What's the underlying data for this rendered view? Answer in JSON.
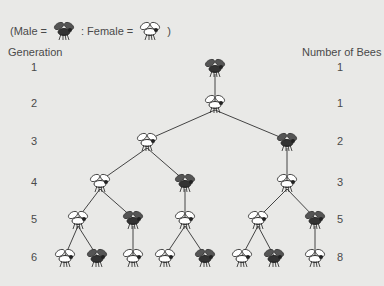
{
  "legend": {
    "open": "(Male =",
    "sep": ": Female =",
    "close": ")",
    "male_icon": "male-bee-icon",
    "female_icon": "female-bee-icon"
  },
  "headers": {
    "left": "Generation",
    "right": "Number of Bees"
  },
  "generations": [
    {
      "gen": "1",
      "count": "1",
      "y": 68
    },
    {
      "gen": "2",
      "count": "1",
      "y": 104
    },
    {
      "gen": "3",
      "count": "2",
      "y": 142
    },
    {
      "gen": "4",
      "count": "3",
      "y": 183
    },
    {
      "gen": "5",
      "count": "5",
      "y": 220
    },
    {
      "gen": "6",
      "count": "8",
      "y": 258
    }
  ],
  "colors": {
    "background": "#e9e9e7",
    "text": "#4a4a4a",
    "line": "#444444",
    "male_body": "#333333",
    "female_body": "#ffffff"
  },
  "tree": {
    "nodes": [
      {
        "id": "a",
        "sex": "M",
        "x": 215,
        "y": 68
      },
      {
        "id": "b",
        "sex": "F",
        "x": 215,
        "y": 104
      },
      {
        "id": "c1",
        "sex": "F",
        "x": 147,
        "y": 142
      },
      {
        "id": "c2",
        "sex": "M",
        "x": 287,
        "y": 142
      },
      {
        "id": "d1",
        "sex": "F",
        "x": 100,
        "y": 183
      },
      {
        "id": "d2",
        "sex": "M",
        "x": 185,
        "y": 183
      },
      {
        "id": "d3",
        "sex": "F",
        "x": 287,
        "y": 183
      },
      {
        "id": "e1",
        "sex": "F",
        "x": 78,
        "y": 220
      },
      {
        "id": "e2",
        "sex": "M",
        "x": 133,
        "y": 220
      },
      {
        "id": "e3",
        "sex": "F",
        "x": 185,
        "y": 220
      },
      {
        "id": "e4",
        "sex": "F",
        "x": 258,
        "y": 220
      },
      {
        "id": "e5",
        "sex": "M",
        "x": 315,
        "y": 220
      },
      {
        "id": "f1",
        "sex": "F",
        "x": 65,
        "y": 258
      },
      {
        "id": "f2",
        "sex": "M",
        "x": 97,
        "y": 258
      },
      {
        "id": "f3",
        "sex": "F",
        "x": 133,
        "y": 258
      },
      {
        "id": "f4",
        "sex": "F",
        "x": 165,
        "y": 258
      },
      {
        "id": "f5",
        "sex": "M",
        "x": 205,
        "y": 258
      },
      {
        "id": "f6",
        "sex": "F",
        "x": 242,
        "y": 258
      },
      {
        "id": "f7",
        "sex": "M",
        "x": 274,
        "y": 258
      },
      {
        "id": "f8",
        "sex": "F",
        "x": 315,
        "y": 258
      }
    ],
    "edges": [
      [
        "a",
        "b"
      ],
      [
        "b",
        "c1"
      ],
      [
        "b",
        "c2"
      ],
      [
        "c1",
        "d1"
      ],
      [
        "c1",
        "d2"
      ],
      [
        "c2",
        "d3"
      ],
      [
        "d1",
        "e1"
      ],
      [
        "d1",
        "e2"
      ],
      [
        "d2",
        "e3"
      ],
      [
        "d3",
        "e4"
      ],
      [
        "d3",
        "e5"
      ],
      [
        "e1",
        "f1"
      ],
      [
        "e1",
        "f2"
      ],
      [
        "e2",
        "f3"
      ],
      [
        "e3",
        "f4"
      ],
      [
        "e3",
        "f5"
      ],
      [
        "e4",
        "f6"
      ],
      [
        "e4",
        "f7"
      ],
      [
        "e5",
        "f8"
      ]
    ]
  }
}
